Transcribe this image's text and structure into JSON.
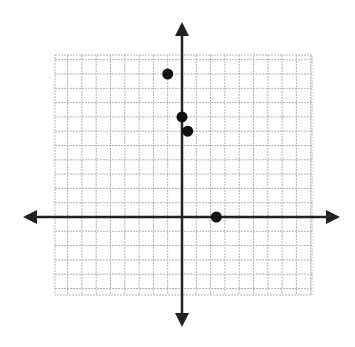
{
  "chart_data": {
    "type": "scatter",
    "title": "",
    "xlabel": "",
    "ylabel": "",
    "grid": true,
    "legend": null,
    "xlim": [
      -9,
      9
    ],
    "ylim": [
      -5,
      11
    ],
    "axes_arrows": true,
    "points": [
      {
        "x": -1,
        "y": 10
      },
      {
        "x": 0,
        "y": 7
      },
      {
        "x": 0.4,
        "y": 6
      },
      {
        "x": 2.4,
        "y": 0
      }
    ]
  },
  "style": {
    "grid_color": "#b4b4b4",
    "axis_color": "#222222",
    "point_color": "#111111"
  },
  "layout": {
    "origin_px": [
      182,
      217
    ],
    "unit_px": 14.3,
    "grid_box": [
      55,
      55,
      312,
      295
    ],
    "x_axis_px": [
      23,
      340
    ],
    "y_axis_px": [
      22,
      327
    ],
    "point_radius": 5.5
  }
}
